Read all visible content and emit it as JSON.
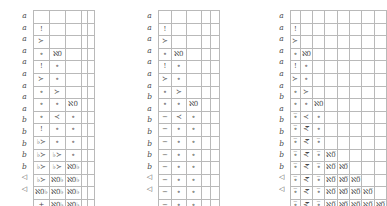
{
  "figure": {
    "title": "",
    "panels": [
      {
        "name": "panel-1",
        "columns": 5,
        "row_labels": [
          "a",
          "a",
          "a",
          "a",
          "a",
          "a",
          "a",
          "a",
          "a",
          "b",
          "b",
          "b",
          "b",
          "b",
          "◁",
          "◁"
        ],
        "rows": [
          [
            "",
            "",
            "",
            "",
            ""
          ],
          [
            "!",
            "",
            "",
            "",
            ""
          ],
          [
            "≻",
            "",
            "",
            "",
            ""
          ],
          [
            "∘",
            "ℵ0",
            "",
            "",
            ""
          ],
          [
            "!",
            "∘",
            "",
            "",
            ""
          ],
          [
            "≻",
            "∘",
            "",
            "",
            ""
          ],
          [
            "∘",
            "≻",
            "",
            "",
            ""
          ],
          [
            "∘",
            "∘",
            "ℵ0",
            "",
            ""
          ],
          [
            "∘",
            "≺",
            "∘",
            "",
            ""
          ],
          [
            "!",
            "∘",
            "∘",
            "",
            ""
          ],
          [
            "♭≻",
            "∘",
            "∘",
            "",
            ""
          ],
          [
            "♭≻",
            "♭≻",
            "∘",
            "",
            ""
          ],
          [
            "♭≻",
            "♭≻",
            "ℵ0♭",
            "",
            ""
          ],
          [
            "♭≻",
            "ℵ0♭",
            "ℵ0♭",
            "",
            ""
          ],
          [
            "ℵ0♭",
            "ℵ0♭",
            "ℵ0♭",
            "",
            ""
          ],
          [
            "+",
            "ℵ0♭",
            "ℵ0♭",
            "",
            ""
          ]
        ]
      },
      {
        "name": "panel-2",
        "columns": 5,
        "row_labels": [
          "a",
          "a",
          "a",
          "a",
          "a",
          "a",
          "a",
          "b",
          "a",
          "b",
          "b",
          "b",
          "b",
          "b",
          "◁",
          "◁"
        ],
        "rows": [
          [
            "",
            "",
            "",
            "",
            ""
          ],
          [
            "!",
            "",
            "",
            "",
            ""
          ],
          [
            "≻",
            "",
            "",
            "",
            ""
          ],
          [
            "∘",
            "ℵ0",
            "",
            "",
            ""
          ],
          [
            "!",
            "∘",
            "",
            "",
            ""
          ],
          [
            "≻",
            "∘",
            "",
            "",
            ""
          ],
          [
            "∘",
            "≻",
            "",
            "",
            ""
          ],
          [
            "∘",
            "∘",
            "ℵ0",
            "",
            ""
          ],
          [
            "−",
            "≺",
            "∘",
            "",
            ""
          ],
          [
            "−",
            "∘",
            "∘",
            "",
            ""
          ],
          [
            "−",
            "∘",
            "∘",
            "",
            ""
          ],
          [
            "−",
            "∘",
            "∘",
            "",
            ""
          ],
          [
            "−",
            "∘",
            "∘",
            "",
            ""
          ],
          [
            "−",
            "∘",
            "∘",
            "",
            ""
          ],
          [
            "−",
            "∘",
            "∘",
            "",
            ""
          ],
          [
            "−",
            "∘",
            "∘",
            "",
            ""
          ]
        ]
      },
      {
        "name": "panel-3",
        "columns": 8,
        "row_labels": [
          "a",
          "a",
          "a",
          "a",
          "a",
          "a",
          "a",
          "b",
          "a",
          "b",
          "b",
          "b",
          "b",
          "b",
          "◁",
          "◁"
        ],
        "rows": [
          [
            "",
            "",
            "",
            "",
            "",
            "",
            "",
            ""
          ],
          [
            "!",
            "",
            "",
            "",
            "",
            "",
            "",
            ""
          ],
          [
            "≻",
            "",
            "",
            "",
            "",
            "",
            "",
            ""
          ],
          [
            "∘",
            "ℵ0",
            "",
            "",
            "",
            "",
            "",
            ""
          ],
          [
            "!",
            "∘",
            "",
            "",
            "",
            "",
            "",
            ""
          ],
          [
            "≻",
            "∘",
            "",
            "",
            "",
            "",
            "",
            ""
          ],
          [
            "∘",
            "≻",
            "",
            "",
            "",
            "",
            "",
            ""
          ],
          [
            "∘",
            "∘",
            "ℵ0",
            "",
            "",
            "",
            "",
            ""
          ],
          [
            "∘̅",
            "≺",
            "∘",
            "",
            "",
            "",
            "",
            ""
          ],
          [
            "∘̅",
            "≺̅",
            "∘",
            "",
            "",
            "",
            "",
            ""
          ],
          [
            "∘̅",
            "≺̅",
            "∘̅",
            "",
            "",
            "",
            "",
            ""
          ],
          [
            "∘̅",
            "≺̅",
            "∘̅",
            "ℵ0̅",
            "",
            "",
            "",
            ""
          ],
          [
            "∘̅",
            "≺̅",
            "∘̅",
            "ℵ0̅",
            "ℵ0̅",
            "",
            "",
            ""
          ],
          [
            "∘̅",
            "≺̅",
            "∘̅",
            "ℵ0̅",
            "ℵ0̅",
            "ℵ0̅",
            "",
            ""
          ],
          [
            "∘̅",
            "≺̅",
            "∘̅",
            "ℵ0̅",
            "ℵ0̅",
            "ℵ0̅",
            "ℵ0̅",
            ""
          ],
          [
            "∘̅",
            "≺̅",
            "∘̅",
            "ℵ0̅",
            "ℵ0̅",
            "ℵ0̅",
            "ℵ0̅",
            "ℵ0̅"
          ]
        ]
      }
    ],
    "colors": {
      "grid_line": "#b9b9b9",
      "text": "#4a4a4a",
      "background": "#ffffff"
    }
  }
}
